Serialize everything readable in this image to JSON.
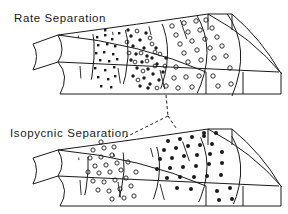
{
  "figure": {
    "kind": "scientific-diagram",
    "background_color": "#ffffff",
    "line_color": "#1a1a1a",
    "panels": [
      {
        "id": "rate-separation",
        "title": "Rate Separation",
        "title_position": {
          "x": 14,
          "y": 18
        },
        "bands": [
          {
            "id": "band-1",
            "marker": "filled-square",
            "label": "small-particles"
          },
          {
            "id": "band-2",
            "marker": "mixed-filled-open",
            "label": "mid-particles"
          },
          {
            "id": "band-3",
            "marker": "open-circle",
            "label": "large-particles"
          }
        ]
      },
      {
        "id": "isopycnic-separation",
        "title": "Isopycnic Separation",
        "title_position": {
          "x": 10,
          "y": 133
        },
        "bands": [
          {
            "id": "band-1",
            "marker": "open-circle",
            "label": "low-density-particles"
          },
          {
            "id": "band-2",
            "marker": "filled-circle",
            "label": "high-density-particles"
          }
        ]
      }
    ],
    "connector": {
      "id": "dashed-connector",
      "style": "dashed",
      "meaning": "relationship between upper and lower rotor band positions"
    }
  }
}
